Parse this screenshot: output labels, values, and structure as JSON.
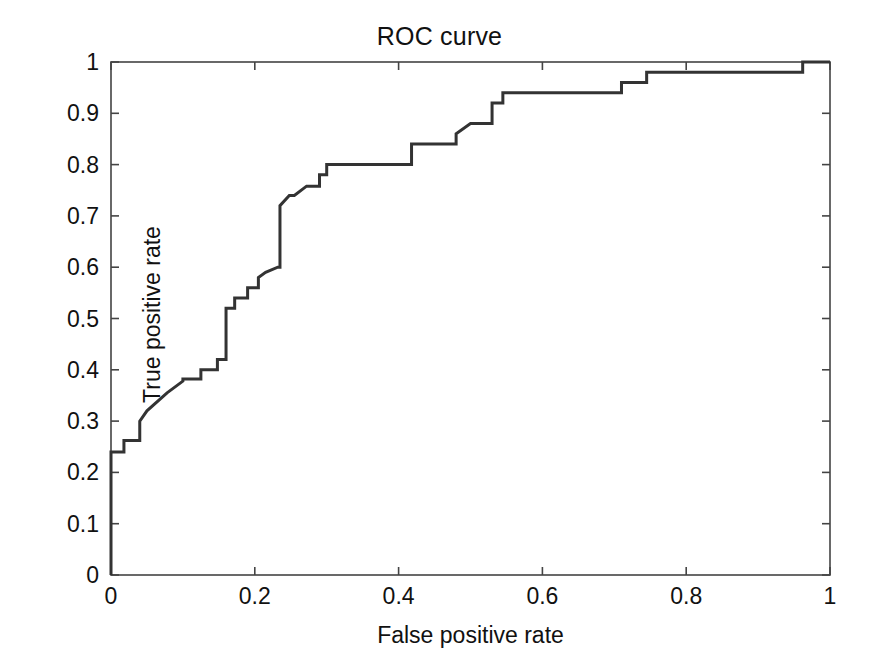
{
  "chart_data": {
    "type": "line",
    "title": "ROC curve",
    "xlabel": "False positive rate",
    "ylabel": "True positive rate",
    "xlim": [
      0,
      1
    ],
    "ylim": [
      0,
      1
    ],
    "grid": false,
    "legend": null,
    "xticks": [
      0,
      0.2,
      0.4,
      0.6,
      0.8,
      1
    ],
    "xticklabels": [
      "0",
      "0.2",
      "0.4",
      "0.6",
      "0.8",
      "1"
    ],
    "yticks": [
      0,
      0.1,
      0.2,
      0.3,
      0.4,
      0.5,
      0.6,
      0.7,
      0.8,
      0.9,
      1
    ],
    "yticklabels": [
      "0",
      "0.1",
      "0.2",
      "0.3",
      "0.4",
      "0.5",
      "0.6",
      "0.7",
      "0.8",
      "0.9",
      "1"
    ],
    "line_color": "#333333",
    "line_width": 3,
    "series": [
      {
        "name": "ROC",
        "x": [
          0.0,
          0.0,
          0.018,
          0.018,
          0.04,
          0.04,
          0.05,
          0.078,
          0.1,
          0.1,
          0.125,
          0.125,
          0.148,
          0.148,
          0.16,
          0.16,
          0.172,
          0.172,
          0.19,
          0.19,
          0.205,
          0.205,
          0.215,
          0.232,
          0.235,
          0.235,
          0.248,
          0.255,
          0.272,
          0.29,
          0.29,
          0.3,
          0.3,
          0.33,
          0.418,
          0.418,
          0.48,
          0.48,
          0.5,
          0.53,
          0.53,
          0.545,
          0.545,
          0.56,
          0.56,
          0.71,
          0.71,
          0.745,
          0.745,
          0.962,
          0.962,
          1.0
        ],
        "y": [
          0.0,
          0.24,
          0.24,
          0.262,
          0.262,
          0.3,
          0.32,
          0.355,
          0.378,
          0.382,
          0.382,
          0.4,
          0.4,
          0.42,
          0.42,
          0.52,
          0.52,
          0.54,
          0.54,
          0.56,
          0.56,
          0.58,
          0.59,
          0.6,
          0.6,
          0.72,
          0.74,
          0.74,
          0.758,
          0.758,
          0.78,
          0.78,
          0.8,
          0.8,
          0.8,
          0.84,
          0.84,
          0.86,
          0.88,
          0.88,
          0.92,
          0.92,
          0.94,
          0.94,
          0.94,
          0.94,
          0.96,
          0.96,
          0.98,
          0.98,
          1.0,
          1.0
        ]
      }
    ]
  },
  "axes": {
    "plot_left_px": 111,
    "plot_top_px": 62,
    "plot_right_px": 830,
    "plot_bottom_px": 575,
    "frame_color": "#444444",
    "tick_direction": "in"
  }
}
